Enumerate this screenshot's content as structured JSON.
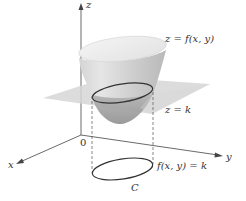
{
  "figure": {
    "labels": {
      "z_axis": "z",
      "x_axis": "x",
      "y_axis": "y",
      "origin": "0",
      "surface": "z = f(x, y)",
      "plane": "z = k",
      "level_curve_eq": "f(x, y) = k",
      "level_curve_name": "C"
    },
    "colors": {
      "surface_light": "#eeeeee",
      "surface_mid": "#c8c8c8",
      "surface_dark": "#9a9a9a",
      "plane": "#d9d9d9",
      "curve": "#333333",
      "axis": "#444444"
    }
  }
}
